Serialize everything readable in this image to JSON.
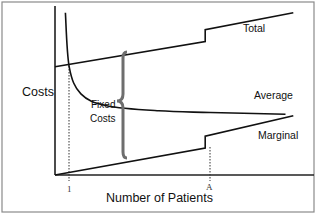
{
  "chart_data": {
    "type": "line",
    "title": "",
    "xlabel": "Number of Patients",
    "ylabel": "Costs",
    "x_ticks": [
      "1",
      "A"
    ],
    "annotations": [
      {
        "text": "Fixed\nCosts",
        "kind": "brace",
        "spans": "between Marginal and Total"
      }
    ],
    "series": [
      {
        "name": "Total",
        "description": "linear rising, step increase at A",
        "points": [
          [
            0,
            0.64
          ],
          [
            0.58,
            0.79
          ],
          [
            0.58,
            0.86
          ],
          [
            0.92,
            0.96
          ]
        ]
      },
      {
        "name": "Average",
        "description": "decreasing, asymptotically flattening",
        "points": [
          [
            0.04,
            0.96
          ],
          [
            0.055,
            0.64
          ],
          [
            0.1,
            0.48
          ],
          [
            0.2,
            0.41
          ],
          [
            0.4,
            0.38
          ],
          [
            0.6,
            0.37
          ],
          [
            0.89,
            0.36
          ]
        ]
      },
      {
        "name": "Marginal",
        "description": "linear rising from origin, step increase at A",
        "points": [
          [
            0,
            0.0
          ],
          [
            0.58,
            0.16
          ],
          [
            0.58,
            0.23
          ],
          [
            0.92,
            0.35
          ]
        ]
      }
    ],
    "reference_lines": [
      {
        "label": "1",
        "x": 0.055,
        "style": "dotted"
      },
      {
        "label": "A",
        "x": 0.58,
        "style": "dotted"
      }
    ],
    "grid": false,
    "legend": "none (inline labels)"
  },
  "labels": {
    "costs": "Costs",
    "patients": "Number of Patients",
    "total": "Total",
    "average": "Average",
    "marginal": "Marginal",
    "fixed_line1": "Fixed",
    "fixed_line2": "Costs",
    "tick_one": "1",
    "tick_a": "A"
  }
}
